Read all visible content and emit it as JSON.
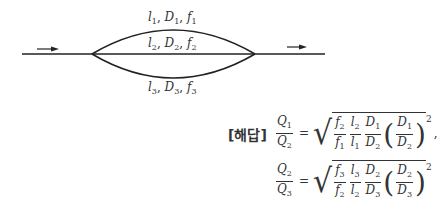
{
  "diagram": {
    "branches": [
      {
        "l": "l",
        "D": "D",
        "f": "f",
        "index": "1",
        "position": "upper"
      },
      {
        "l": "l",
        "D": "D",
        "f": "f",
        "index": "2",
        "position": "middle"
      },
      {
        "l": "l",
        "D": "D",
        "f": "f",
        "index": "3",
        "position": "lower"
      }
    ],
    "flow_arrows": [
      "inlet-arrow",
      "outlet-arrow"
    ]
  },
  "answer": {
    "tag": "[해답]",
    "eq1": {
      "lhs_num": "Q",
      "lhs_num_sub": "1",
      "lhs_den": "Q",
      "lhs_den_sub": "2",
      "eq": "=",
      "t1_num": "f",
      "t1_num_sub": "2",
      "t1_den": "f",
      "t1_den_sub": "1",
      "t2_num": "l",
      "t2_num_sub": "2",
      "t2_den": "l",
      "t2_den_sub": "1",
      "t3_num": "D",
      "t3_num_sub": "1",
      "t3_den": "D",
      "t3_den_sub": "2",
      "p_num": "D",
      "p_num_sub": "1",
      "p_den": "D",
      "p_den_sub": "2",
      "exp": "2",
      "trail": ","
    },
    "eq2": {
      "lhs_num": "Q",
      "lhs_num_sub": "2",
      "lhs_den": "Q",
      "lhs_den_sub": "3",
      "eq": "=",
      "t1_num": "f",
      "t1_num_sub": "3",
      "t1_den": "f",
      "t1_den_sub": "2",
      "t2_num": "l",
      "t2_num_sub": "3",
      "t2_den": "l",
      "t2_den_sub": "2",
      "t3_num": "D",
      "t3_num_sub": "2",
      "t3_den": "D",
      "t3_den_sub": "3",
      "p_num": "D",
      "p_num_sub": "2",
      "p_den": "D",
      "p_den_sub": "3",
      "exp": "2"
    }
  },
  "labels": {
    "sep": ", ",
    "open_paren": "(",
    "close_paren": ")",
    "radical": "√"
  }
}
